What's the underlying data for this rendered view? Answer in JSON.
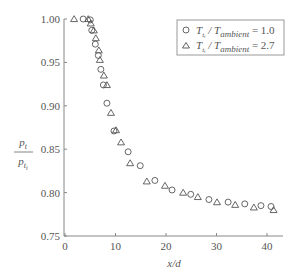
{
  "chart_data": {
    "type": "scatter",
    "title": "",
    "xlabel": "x/d",
    "ylabel": "p_t / p_t_i",
    "xlim": [
      0,
      43
    ],
    "ylim": [
      0.75,
      1.0
    ],
    "x_ticks": [
      0,
      10,
      20,
      30,
      40
    ],
    "x_tick_labels": [
      "0",
      "10",
      "20",
      "30",
      "40"
    ],
    "y_ticks": [
      0.75,
      0.8,
      0.85,
      0.9,
      0.95,
      1.0
    ],
    "y_tick_labels": [
      "0.75",
      "0.80",
      "0.85",
      "0.90",
      "0.95",
      "1.00"
    ],
    "grid": false,
    "legend_position": "upper right",
    "series": [
      {
        "name": "T_t_i / T_ambient = 1.0",
        "marker": "circle",
        "x": [
          3.6,
          5.0,
          5.3,
          6.0,
          6.6,
          7.1,
          7.6,
          8.3,
          9.7,
          12.5,
          14.9,
          17.8,
          21.2,
          24.9,
          28.5,
          32.3,
          35.6,
          38.8,
          40.8
        ],
        "y": [
          1.0,
          0.999,
          0.987,
          0.971,
          0.958,
          0.942,
          0.924,
          0.903,
          0.871,
          0.847,
          0.831,
          0.814,
          0.803,
          0.798,
          0.792,
          0.789,
          0.787,
          0.785,
          0.784
        ]
      },
      {
        "name": "T_t_i / T_ambient = 2.7",
        "marker": "triangle",
        "x": [
          1.8,
          4.6,
          5.1,
          5.7,
          6.1,
          6.7,
          6.9,
          7.7,
          8.3,
          9.1,
          10.1,
          11.1,
          12.9,
          16.2,
          19.8,
          23.4,
          26.3,
          30.1,
          33.7,
          37.4,
          41.3
        ],
        "y": [
          1.0,
          1.0,
          0.995,
          0.987,
          0.978,
          0.964,
          0.953,
          0.935,
          0.924,
          0.892,
          0.872,
          0.858,
          0.834,
          0.813,
          0.808,
          0.8,
          0.795,
          0.789,
          0.786,
          0.783,
          0.78
        ]
      }
    ]
  },
  "legend": {
    "items": [
      {
        "marker": "circle",
        "prefix": "T",
        "sub": "t",
        "subsub": "i",
        "mid": " / T",
        "sub2": "ambient",
        "value": " = 1.0"
      },
      {
        "marker": "triangle",
        "prefix": "T",
        "sub": "t",
        "subsub": "i",
        "mid": " / T",
        "sub2": "ambient",
        "value": " = 2.7"
      }
    ]
  },
  "axes": {
    "xlabel": "x/d",
    "ylabel_num": "p",
    "ylabel_num_sub": "t",
    "ylabel_den": "p",
    "ylabel_den_sub": "t",
    "ylabel_den_subsub": "i"
  },
  "colors": {
    "axis": "#888888",
    "marker": "#555555",
    "legend_border": "#999999"
  }
}
